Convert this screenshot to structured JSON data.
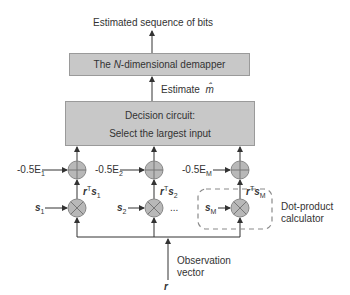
{
  "output_label": "Estimated sequence of bits",
  "demapper": {
    "label_prefix": "The ",
    "label_n": "N",
    "label_suffix": "-dimensional demapper"
  },
  "estimate": {
    "label": "Estimate",
    "symbol": "m̂"
  },
  "decision": {
    "line1": "Decision circuit:",
    "line2": "Select the largest input"
  },
  "branches": [
    {
      "energy": "-0.5E",
      "energy_sub": "1",
      "dot": "r",
      "dot_s": "s",
      "dot_sub": "1",
      "input": "s",
      "input_sub": "1"
    },
    {
      "energy": "-0.5E",
      "energy_sub": "2",
      "dot": "r",
      "dot_s": "s",
      "dot_sub": "2",
      "input": "s",
      "input_sub": "2"
    },
    {
      "energy": "-0.5E",
      "energy_sub": "M",
      "dot": "r",
      "dot_s": "s",
      "dot_sub": "M",
      "input": "s",
      "input_sub": "M"
    }
  ],
  "ellipsis": "...",
  "transpose": "T",
  "dot_product_label": {
    "line1": "Dot-product",
    "line2": "calculator"
  },
  "observation": {
    "symbol": "r",
    "line1": "Observation",
    "line2": "vector"
  },
  "colors": {
    "box_fill": "#c8c8c8",
    "circle_fill": "#b8b8b8",
    "line": "#333333",
    "dashed": "#8a8a8a"
  }
}
